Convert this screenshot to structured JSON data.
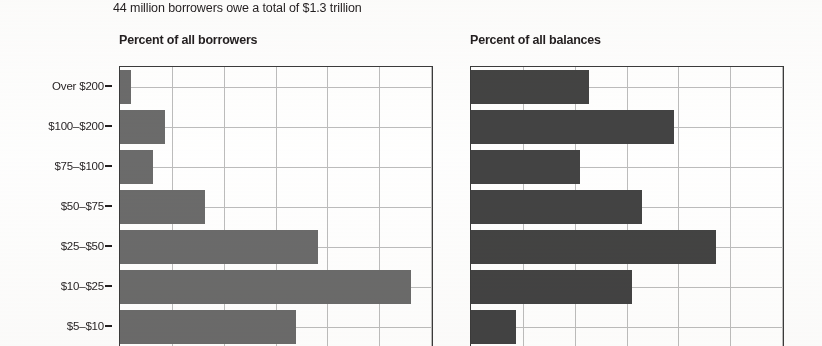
{
  "headline": "44 million borrowers owe a total of $1.3 trillion",
  "axis_title": "Amount owed, in thousands of dollars",
  "panels": {
    "left_title": "Percent of all borrowers",
    "right_title": "Percent of all balances"
  },
  "colors": {
    "bar_left": "#6b6b6b",
    "bar_right": "#434343",
    "gridline": "#bdbdbd",
    "axis": "#3b3b3b",
    "text": "#231f20",
    "background": "#ffffff"
  },
  "categories": [
    "Over $200",
    "$100–$200",
    "$75–$100",
    "$50–$75",
    "$25–$50",
    "$10–$25",
    "$5–$10"
  ],
  "chart_data": {
    "type": "bar",
    "orientation": "horizontal",
    "title": "44 million borrowers owe a total of $1.3 trillion",
    "ylabel": "Amount owed, in thousands of dollars",
    "xlabel": "",
    "categories": [
      "Over $200",
      "$100–$200",
      "$75–$100",
      "$50–$75",
      "$25–$50",
      "$10–$25",
      "$5–$10"
    ],
    "panels": [
      {
        "name": "Percent of all borrowers",
        "values": [
          1.1,
          4.3,
          3.2,
          8.2,
          19.1,
          28.1,
          17.0
        ],
        "xlim": [
          0,
          30
        ],
        "xticks": [
          0,
          5,
          10,
          15,
          20,
          25,
          30
        ]
      },
      {
        "name": "Percent of all balances",
        "values": [
          11.4,
          19.6,
          10.5,
          16.5,
          23.6,
          15.5,
          4.3
        ],
        "xlim": [
          0,
          30
        ],
        "xticks": [
          0,
          5,
          10,
          15,
          20,
          25,
          30
        ]
      }
    ],
    "grid": true,
    "legend": "none",
    "note": "Bottom of figure is cropped; the $5–$10 category bars extend past the lower edge of the image."
  }
}
